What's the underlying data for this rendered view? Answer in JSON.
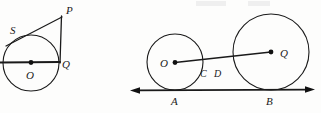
{
  "figure": {
    "title": "",
    "background_color": "#fdfdfc",
    "ink_color": "#1a1a1a",
    "width": 321,
    "height": 113
  },
  "left_diagram": {
    "name": "circle-with-external-point-tangents",
    "labels": {
      "center": "O",
      "tangent_point_upper": "S",
      "point_on_circle_right": "Q",
      "external_point": "P"
    },
    "circle": {
      "cx": 31,
      "cy": 63,
      "r": 28
    },
    "points": {
      "O": {
        "x": 31,
        "y": 63
      },
      "Q": {
        "x": 59,
        "y": 62
      },
      "S": {
        "x": 12,
        "y": 40
      },
      "P": {
        "x": 62,
        "y": 17
      }
    },
    "label_positions": {
      "O": {
        "x": 27,
        "y": 78
      },
      "Q": {
        "x": 63,
        "y": 67
      },
      "S": {
        "x": 12,
        "y": 33
      },
      "P": {
        "x": 66,
        "y": 13
      }
    },
    "segments": [
      {
        "name": "diameter-line",
        "from": "left-edge",
        "to": "Q"
      },
      {
        "name": "tangent-SP",
        "from": "S",
        "to": "P"
      },
      {
        "name": "segment-PQ",
        "from": "P",
        "to": "Q"
      }
    ]
  },
  "right_diagram": {
    "name": "two-circles-tangent-to-common-line",
    "labels": {
      "small_center": "O",
      "large_center": "Q",
      "intersection_near": "C",
      "intersection_far": "D",
      "tangent_point_small": "A",
      "tangent_point_large": "B"
    },
    "small_circle": {
      "cx": 175,
      "cy": 62,
      "r": 28
    },
    "large_circle": {
      "cx": 271,
      "cy": 52,
      "r": 38
    },
    "points": {
      "O": {
        "x": 175,
        "y": 62
      },
      "Q": {
        "x": 271,
        "y": 52
      },
      "C": {
        "x": 203,
        "y": 64
      },
      "D": {
        "x": 233,
        "y": 62
      },
      "A": {
        "x": 175,
        "y": 90
      },
      "B": {
        "x": 271,
        "y": 90
      }
    },
    "label_positions": {
      "O": {
        "x": 163,
        "y": 66
      },
      "Q": {
        "x": 281,
        "y": 56
      },
      "C": {
        "x": 203,
        "y": 76
      },
      "D": {
        "x": 217,
        "y": 76
      },
      "A": {
        "x": 173,
        "y": 104
      },
      "B": {
        "x": 267,
        "y": 104
      }
    },
    "tangent_line": {
      "name": "common-tangent-line",
      "y": 90,
      "x_start": 130,
      "x_end": 315,
      "arrow_left": true,
      "arrow_right": true
    },
    "segments": [
      {
        "name": "center-line-OQ",
        "from": "O",
        "to": "Q"
      }
    ]
  }
}
